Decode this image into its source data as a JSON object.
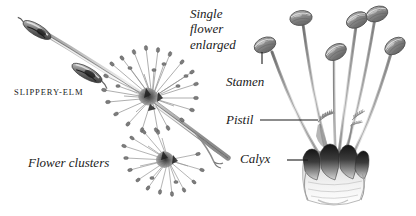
{
  "plate": {
    "subject": "Slippery-Elm",
    "background_color": "#ffffff",
    "ink_color": "#1a1a1a",
    "labels": {
      "species": "SLIPPERY-ELM",
      "flower_clusters": "Flower clusters",
      "single_flower_line1": "Single",
      "single_flower_line2": "flower",
      "single_flower_line3": "enlarged",
      "stamen": "Stamen",
      "pistil": "Pistil",
      "calyx": "Calyx"
    },
    "icons": {
      "flower_cluster": "flower-cluster-icon",
      "bud": "bud-icon",
      "twig": "twig-icon",
      "anther": "anther-icon",
      "filament": "filament-icon",
      "pistil_style": "feathery-style-icon",
      "calyx_cup": "calyx-cup-icon",
      "leader_line": "leader-line-icon"
    },
    "counts": {
      "stamens": 6,
      "buds": 2,
      "clusters": 2,
      "calyx_lobes": 5
    }
  }
}
